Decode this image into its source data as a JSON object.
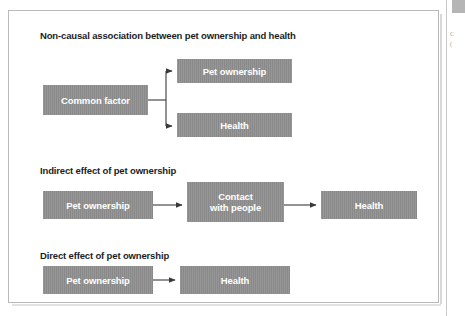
{
  "figure": {
    "sections": [
      {
        "id": "non-causal",
        "heading": "Non-causal association between pet ownership and health",
        "nodes": [
          {
            "id": "common-factor",
            "label": "Common factor"
          },
          {
            "id": "pet-ownership",
            "label": "Pet ownership"
          },
          {
            "id": "health",
            "label": "Health"
          }
        ],
        "edges": [
          {
            "from": "common-factor",
            "to": "pet-ownership",
            "style": "elbow-arrow"
          },
          {
            "from": "common-factor",
            "to": "health",
            "style": "elbow-arrow"
          }
        ]
      },
      {
        "id": "indirect-effect",
        "heading": "Indirect effect of pet ownership",
        "nodes": [
          {
            "id": "pet-ownership-2",
            "label": "Pet ownership"
          },
          {
            "id": "contact-with-people",
            "label_line1": "Contact",
            "label_line2": "with people"
          },
          {
            "id": "health-2",
            "label": "Health"
          }
        ],
        "edges": [
          {
            "from": "pet-ownership-2",
            "to": "contact-with-people",
            "style": "straight-arrow"
          },
          {
            "from": "contact-with-people",
            "to": "health-2",
            "style": "straight-arrow"
          }
        ]
      },
      {
        "id": "direct-effect",
        "heading": "Direct effect of pet ownership",
        "nodes": [
          {
            "id": "pet-ownership-3",
            "label": "Pet ownership"
          },
          {
            "id": "health-3",
            "label": "Health"
          }
        ],
        "edges": [
          {
            "from": "pet-ownership-3",
            "to": "health-3",
            "style": "straight-arrow"
          }
        ]
      }
    ],
    "colors": {
      "node_fill": "#8d8d8d",
      "node_text": "#ffffff",
      "heading_text": "#1d1d1d",
      "connector": "#3a3a3a",
      "frame_border": "#b9b9b9",
      "page_background": "#ffffff"
    }
  },
  "page_margin": {
    "fragment_line1": "C",
    "fragment_line2": "("
  }
}
